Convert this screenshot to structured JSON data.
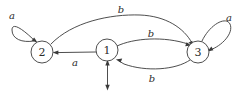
{
  "figure": {
    "background_color": "#ffffff",
    "stroke_color": "#3a3a3a",
    "text_color": "#2b2b2b",
    "width": 244,
    "height": 91
  },
  "states": [
    {
      "id": "1",
      "label": "1",
      "cx": 107,
      "cy": 50,
      "r": 11,
      "is_start": true
    },
    {
      "id": "2",
      "label": "2",
      "cx": 42,
      "cy": 52,
      "r": 11,
      "is_start": false
    },
    {
      "id": "3",
      "label": "3",
      "cx": 198,
      "cy": 52,
      "r": 11,
      "is_start": false
    }
  ],
  "transitions": [
    {
      "id": "t-2-2",
      "from": "2",
      "to": "2",
      "symbol": "a",
      "label_x": 12,
      "label_y": 15,
      "kind": "self-loop"
    },
    {
      "id": "t-3-3",
      "from": "3",
      "to": "3",
      "symbol": "a",
      "label_x": 229,
      "label_y": 17,
      "kind": "self-loop"
    },
    {
      "id": "t-1-2",
      "from": "1",
      "to": "2",
      "symbol": "a",
      "label_x": 75,
      "label_y": 62,
      "kind": "straight"
    },
    {
      "id": "t-2-3-top",
      "from": "2",
      "to": "3",
      "symbol": "b",
      "label_x": 121,
      "label_y": 9,
      "kind": "arc"
    },
    {
      "id": "t-1-3-upper",
      "from": "1",
      "to": "3",
      "symbol": "b",
      "label_x": 151,
      "label_y": 33,
      "kind": "arc"
    },
    {
      "id": "t-3-1-lower",
      "from": "3",
      "to": "1",
      "symbol": "b",
      "label_x": 152,
      "label_y": 78,
      "kind": "arc"
    }
  ],
  "start_marker": {
    "target_state": "1",
    "description": "incoming start arrow from below state 1"
  }
}
